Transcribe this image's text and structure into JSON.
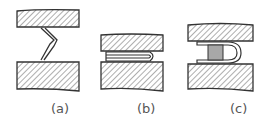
{
  "figure": {
    "panels": [
      {
        "id": "a",
        "label": "(a)",
        "description": "Bent spring clip between two hatched plates, uncompressed"
      },
      {
        "id": "b",
        "label": "(b)",
        "description": "Flattened folded clip compressed between two hatched plates"
      },
      {
        "id": "c",
        "label": "(c)",
        "description": "U-shaped folded clip with shaded insert between two hatched plates"
      }
    ]
  },
  "colors": {
    "outline": "#333333",
    "hatch": "#777777",
    "insert_fill": "#a8a8a8",
    "background": "#ffffff"
  }
}
